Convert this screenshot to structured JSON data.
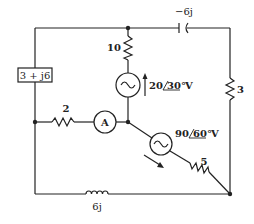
{
  "diagram": {
    "type": "circuit",
    "components": {
      "impedance_box": {
        "label": "3 + j6"
      },
      "resistor_10": {
        "label": "10"
      },
      "capacitor": {
        "label": "−6j"
      },
      "resistor_3": {
        "label": "3"
      },
      "resistor_2": {
        "label": "2"
      },
      "ammeter": {
        "label": "A"
      },
      "source_1": {
        "magnitude": "20",
        "angle": "30°",
        "unit": "V"
      },
      "source_2": {
        "magnitude": "90",
        "angle": "60°",
        "unit": "V"
      },
      "resistor_5": {
        "label": "5"
      },
      "inductor": {
        "label": "6j"
      }
    },
    "colors": {
      "line": "#222222",
      "background": "#ffffff"
    }
  }
}
